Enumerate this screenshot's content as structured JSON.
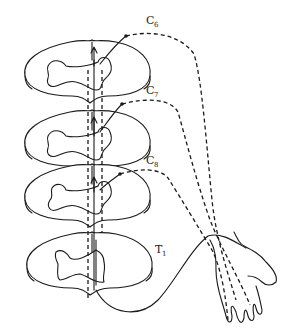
{
  "figure": {
    "type": "anatomical-diagram",
    "segments": [
      {
        "id": "c6",
        "letter": "C",
        "subscript": "6",
        "pathway": "dashed"
      },
      {
        "id": "c7",
        "letter": "C",
        "subscript": "7",
        "pathway": "dashed"
      },
      {
        "id": "c8",
        "letter": "C",
        "subscript": "8",
        "pathway": "dashed"
      },
      {
        "id": "t1",
        "letter": "T",
        "subscript": "1",
        "pathway": "solid"
      }
    ],
    "colors": {
      "line": "#1a1a1a",
      "background": "#ffffff"
    }
  }
}
